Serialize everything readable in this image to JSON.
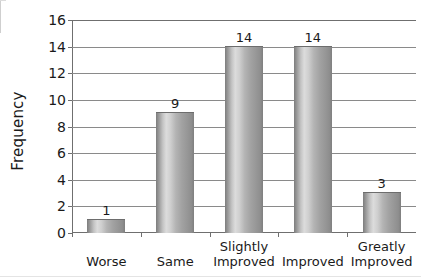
{
  "chart_data": {
    "type": "bar",
    "title": "",
    "subtitle": "",
    "xlabel": "",
    "ylabel": "Frequency",
    "categories": [
      "Worse",
      "Same",
      "Slightly Improved",
      "Improved",
      "Greatly Improved"
    ],
    "category_lines": [
      [
        "Worse"
      ],
      [
        "Same"
      ],
      [
        "Slightly",
        "Improved"
      ],
      [
        "Improved"
      ],
      [
        "Greatly",
        "Improved"
      ]
    ],
    "values": [
      1,
      9,
      14,
      14,
      3
    ],
    "data_labels": [
      "1",
      "9",
      "14",
      "14",
      "3"
    ],
    "ylim": [
      0,
      16
    ],
    "ytick_step": 2,
    "yticks": [
      16,
      14,
      12,
      10,
      8,
      6,
      4,
      2,
      0
    ],
    "ytick_labels": [
      "16",
      "14",
      "12",
      "10",
      "8",
      "6",
      "4",
      "2",
      "0"
    ],
    "grid": true,
    "grid_axis": "y",
    "legend": false,
    "legend_position": "none",
    "bar_style": "cylinder-gradient",
    "colors": {
      "bar_edge": "#7d7d7d",
      "bar_highlight": "#dcdcdc",
      "bar_mid": "#b4b4b4",
      "gridline": "#8a8a8a",
      "axis": "#6f6f6f",
      "text": "#1a1a1a",
      "background": "#ffffff"
    }
  }
}
